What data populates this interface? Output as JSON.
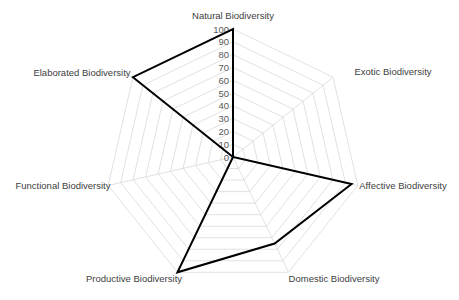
{
  "chart_data": {
    "type": "radar",
    "title": "",
    "categories": [
      "Natural Biodiversity",
      "Exotic Biodiversity",
      "Affective Biodiversity",
      "Domestic Biodiversity",
      "Productive Biodiversity",
      "Functional Biodiversity",
      "Elaborated Biodiversity"
    ],
    "series": [
      {
        "name": "Series 1",
        "values": [
          100,
          0,
          95,
          75,
          100,
          0,
          100
        ],
        "color": "#000000"
      }
    ],
    "rlim": [
      0,
      100
    ],
    "ticks": [
      "0",
      "10",
      "20",
      "30",
      "40",
      "50",
      "60",
      "70",
      "80",
      "90",
      "100"
    ],
    "grid": true,
    "grid_color": "#d9d9d9",
    "legend": "none"
  }
}
